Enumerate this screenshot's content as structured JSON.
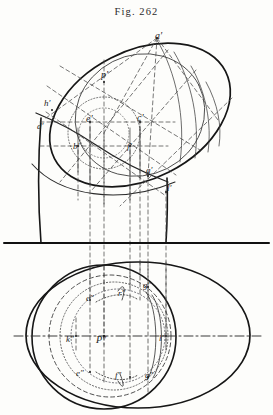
{
  "figure": {
    "title": "Fig. 262",
    "domain_kind": "descriptive-geometry-plate",
    "ground_line_y": 243
  },
  "elevation": {
    "name": "upper-elevation-view",
    "labels": [
      {
        "id": "a-prime",
        "text": "a′",
        "x": 155,
        "y": 31
      },
      {
        "id": "p-prime",
        "text": "p′",
        "x": 101,
        "y": 70
      },
      {
        "id": "h-prime",
        "text": "h′",
        "x": 44,
        "y": 99
      },
      {
        "id": "d-prime",
        "text": "d′",
        "x": 37,
        "y": 122
      },
      {
        "id": "e-prime",
        "text": "e′",
        "x": 86,
        "y": 114
      },
      {
        "id": "c-prime",
        "text": "c′",
        "x": 137,
        "y": 113
      },
      {
        "id": "b-prime",
        "text": "b′",
        "x": 73,
        "y": 142
      },
      {
        "id": "f-prime",
        "text": "f′",
        "x": 127,
        "y": 142
      },
      {
        "id": "g-prime",
        "text": "g′",
        "x": 146,
        "y": 166
      },
      {
        "id": "l-prime",
        "text": "l′",
        "x": 167,
        "y": 184
      }
    ]
  },
  "plan": {
    "name": "lower-plan-view",
    "labels": [
      {
        "id": "e-dbl-upper",
        "text": "e″",
        "x": 86,
        "y": 294
      },
      {
        "id": "r-dbl",
        "text": "r″",
        "x": 118,
        "y": 289
      },
      {
        "id": "g-dbl-upper",
        "text": "g″",
        "x": 143,
        "y": 281
      },
      {
        "id": "k-dbl",
        "text": "k″",
        "x": 66,
        "y": 335
      },
      {
        "id": "p-dbl",
        "text": "P″",
        "x": 96,
        "y": 335
      },
      {
        "id": "l-dbl",
        "text": "l″",
        "x": 159,
        "y": 334
      },
      {
        "id": "e-dbl-lower",
        "text": "e″",
        "x": 76,
        "y": 369
      },
      {
        "id": "f-dbl",
        "text": "f″",
        "x": 115,
        "y": 371
      },
      {
        "id": "g-dbl-lower",
        "text": "g″",
        "x": 145,
        "y": 371
      }
    ]
  },
  "style": {
    "ink": "#1d1d1d",
    "light_ink": "#55555a",
    "paper": "#fdfdfb"
  }
}
